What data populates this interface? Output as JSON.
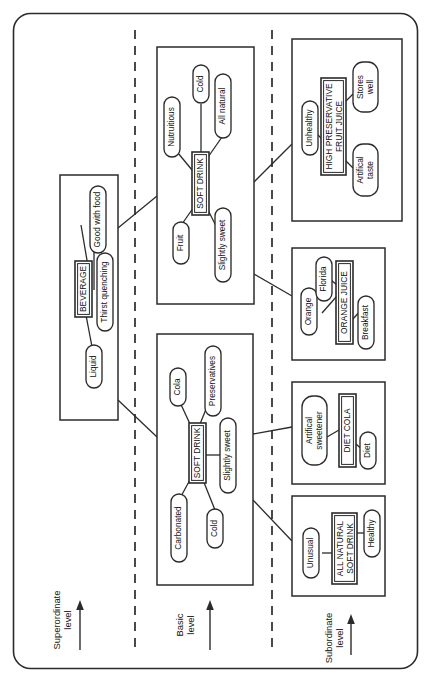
{
  "figure": {
    "orientation": "rotated-90-ccw",
    "canvas": {
      "width": 429,
      "height": 682
    },
    "stroke_color": "#2b2b2b",
    "background_color": "#ffffff"
  },
  "levels": [
    {
      "id": "superordinate",
      "label_line1": "Superordinate",
      "label_line2": "level"
    },
    {
      "id": "basic",
      "label_line1": "Basic",
      "label_line2": "level"
    },
    {
      "id": "subordinate",
      "label_line1": "Subordinate",
      "label_line2": "level"
    }
  ],
  "clusters": [
    {
      "id": "beverage",
      "level": "superordinate",
      "concept": "BEVERAGE",
      "attributes": [
        "Good with food",
        "Thirst quenching",
        "Liquid"
      ]
    },
    {
      "id": "soft-drink-juice",
      "level": "basic",
      "concept": "SOFT DRINK",
      "attributes": [
        "Nutruitious",
        "Cold",
        "All natural",
        "Fruit",
        "Slightly sweet"
      ]
    },
    {
      "id": "soft-drink-cola",
      "level": "basic",
      "concept": "SOFT DRINK",
      "attributes": [
        "Cola",
        "Preservatives",
        "Slightly sweet",
        "Carbonated",
        "Cold"
      ]
    },
    {
      "id": "high-preservative-fruit-juice",
      "level": "subordinate",
      "concept": "HIGH PRESERVATIVE FRUIT JUICE",
      "concept_line1": "HIGH PRESERVATIVE",
      "concept_line2": "FRUIT JUICE",
      "attributes": [
        "Unhealthy",
        "Stores well",
        "Artifical taste"
      ]
    },
    {
      "id": "orange-juice",
      "level": "subordinate",
      "concept": "ORANGE JUICE",
      "attributes": [
        "Orange",
        "Florida",
        "Breakfast"
      ]
    },
    {
      "id": "diet-cola",
      "level": "subordinate",
      "concept": "DIET COLA",
      "attributes": [
        "Artifical sweetener",
        "Diet"
      ]
    },
    {
      "id": "all-natural-soft-drink",
      "level": "subordinate",
      "concept": "ALL NATURAL SOFT DRINK",
      "concept_line1": "ALL NATURAL",
      "concept_line2": "SOFT DRINK",
      "attributes": [
        "Unusual",
        "Healthy"
      ]
    }
  ],
  "nodes": {
    "beverage_concept": "BEVERAGE",
    "beverage_good_with_food": "Good with food",
    "beverage_thirst_quenching": "Thirst quenching",
    "beverage_liquid": "Liquid",
    "juice_concept": "SOFT DRINK",
    "juice_nutruitious": "Nutruitious",
    "juice_cold": "Cold",
    "juice_all_natural": "All natural",
    "juice_fruit": "Fruit",
    "juice_slightly_sweet": "Slightly sweet",
    "cola_concept": "SOFT DRINK",
    "cola_cola": "Cola",
    "cola_preservatives": "Preservatives",
    "cola_slightly_sweet": "Slightly sweet",
    "cola_carbonated": "Carbonated",
    "cola_cold": "Cold",
    "hpfj_concept_line1": "HIGH PRESERVATIVE",
    "hpfj_concept_line2": "FRUIT JUICE",
    "hpfj_unhealthy": "Unhealthy",
    "hpfj_stores_line1": "Stores",
    "hpfj_stores_line2": "well",
    "hpfj_artifical_line1": "Artifical",
    "hpfj_artifical_line2": "taste",
    "oj_concept": "ORANGE JUICE",
    "oj_orange": "Orange",
    "oj_florida": "Florida",
    "oj_breakfast": "Breakfast",
    "dc_concept": "DIET COLA",
    "dc_sweetener_line1": "Artifical",
    "dc_sweetener_line2": "sweetener",
    "dc_diet": "Diet",
    "ansd_concept_line1": "ALL NATURAL",
    "ansd_concept_line2": "SOFT DRINK",
    "ansd_unusual": "Unusual",
    "ansd_healthy": "Healthy"
  },
  "level_labels": {
    "superordinate_l1": "Superordinate",
    "superordinate_l2": "level",
    "basic_l1": "Basic",
    "basic_l2": "level",
    "subordinate_l1": "Subordinate",
    "subordinate_l2": "level"
  }
}
